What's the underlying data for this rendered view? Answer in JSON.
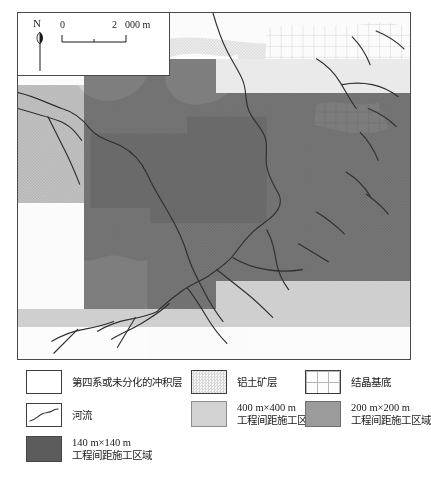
{
  "map": {
    "title": "",
    "north_label": "N",
    "scale_bar": {
      "start": "0",
      "mid": "2",
      "end_unit": "000 m"
    }
  },
  "legend": {
    "items": [
      {
        "id": "quaternary",
        "swatch": "plain-white-box",
        "line1": "第四系或未分化的冲积层",
        "line2": ""
      },
      {
        "id": "bauxite",
        "swatch": "stipple-box",
        "line1": "铝土矿层",
        "line2": ""
      },
      {
        "id": "basement",
        "swatch": "grid-box",
        "line1": "结晶基底",
        "line2": ""
      },
      {
        "id": "river",
        "swatch": "river-line-box",
        "line1": "河流",
        "line2": ""
      },
      {
        "id": "zone-400",
        "swatch": "light-gray-box",
        "line1": "400 m×400 m",
        "line2": "工程间距施工区域"
      },
      {
        "id": "zone-200",
        "swatch": "mid-gray-box",
        "line1": "200 m×200 m",
        "line2": "工程间距施工区域"
      },
      {
        "id": "zone-140",
        "swatch": "dark-gray-box",
        "line1": "140 m×140 m",
        "line2": "工程间距施工区域"
      }
    ]
  },
  "colors": {
    "zone_400": "#d2d2d2",
    "zone_200": "#9b9b9b",
    "zone_140": "#5c5c5c",
    "river": "#2b2b2b",
    "frame": "#4a4a4a"
  }
}
